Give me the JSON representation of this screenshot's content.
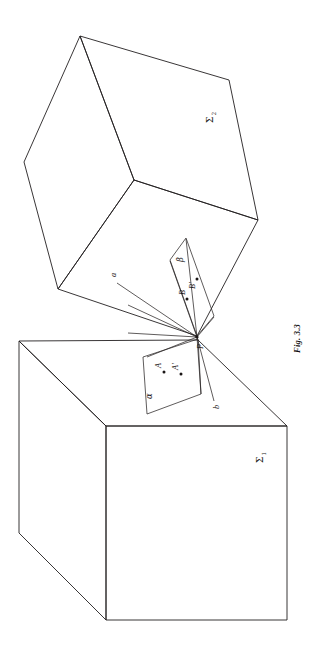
{
  "figure": {
    "caption": "Fig. 3.3",
    "rotation_deg": 90,
    "background_color": "#ffffff",
    "ink_color": "#231f20"
  },
  "labels": {
    "sigma_upper_base": "Σ",
    "sigma_upper_sub": "2",
    "sigma_lower_base": "Σ",
    "sigma_lower_sub": "1",
    "plane_alpha": "α",
    "plane_beta": "β",
    "point_P": "P",
    "point_A": "A",
    "point_A_prime": "A'",
    "point_B": "B",
    "point_B_prime": "B'",
    "line_a": "a",
    "line_b": "b"
  },
  "geometry": {
    "cube_upper": {
      "name": "Sigma-2",
      "top_vertex": [
        80,
        36
      ],
      "left_vertex": [
        24,
        162
      ],
      "front_vertex": [
        58,
        289
      ],
      "mid_vertex": [
        134,
        180
      ],
      "right_vertex": [
        258,
        220
      ],
      "back_right_vertex": [
        229,
        80
      ],
      "bottom_vertex": [
        197,
        336
      ]
    },
    "cube_lower": {
      "name": "Sigma-1",
      "top_left_vertex": [
        19,
        341
      ],
      "bottom_left_vertex": [
        19,
        533
      ],
      "inner_corner": [
        106,
        426
      ],
      "inner_bottom": [
        106,
        620
      ],
      "right_top_vertex": [
        287,
        426
      ],
      "right_bottom_vertex": [
        287,
        620
      ],
      "apex_vertex": [
        198,
        340
      ]
    },
    "parallelogram_alpha": {
      "vertices": [
        [
          198,
          339
        ],
        [
          143,
          356
        ],
        [
          146,
          414
        ],
        [
          200,
          395
        ]
      ]
    },
    "parallelogram_beta": {
      "vertices": [
        [
          198,
          336
        ],
        [
          185,
          240
        ],
        [
          208,
          265
        ],
        [
          214,
          350
        ]
      ]
    },
    "point_P": [
      197,
      337
    ],
    "point_A": [
      162,
      370
    ],
    "point_A_prime": [
      180,
      372
    ],
    "point_B": [
      187,
      297
    ],
    "point_B_prime": [
      196,
      277
    ],
    "line_a_endpoint": [
      118,
      283
    ],
    "line_b_endpoint": [
      214,
      400
    ]
  }
}
